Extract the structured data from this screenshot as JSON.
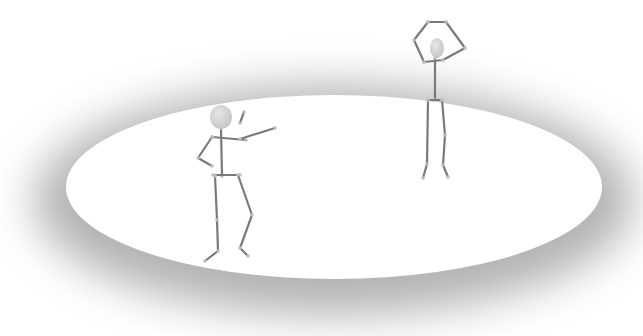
{
  "scene": {
    "description": "Two stick figures on an elliptical white platform with soft gray shadow",
    "colors": {
      "background": "#ffffff",
      "platform": "#ffffff",
      "shadow": "#9a9a9a",
      "limb": "#7a7a7a",
      "joint": "#bdbdbd",
      "head": "#d4d4d4"
    },
    "platform": {
      "cx": 334,
      "cy": 187,
      "rx": 268,
      "ry": 92
    },
    "figures": [
      {
        "name": "pointing-figure",
        "pose": "one hand on hip, other arm extended",
        "head": {
          "cx": 221,
          "cy": 117,
          "rx": 11,
          "ry": 12
        },
        "limbs": [
          [
            [
              221,
              128
            ],
            [
              222,
              176
            ]
          ],
          [
            [
              212,
              137
            ],
            [
              246,
              140
            ]
          ],
          [
            [
              212,
              137
            ],
            [
              198,
              158
            ],
            [
              212,
              166
            ]
          ],
          [
            [
              240,
              139
            ],
            [
              275,
              128
            ]
          ],
          [
            [
              244,
              112
            ],
            [
              240,
              123
            ]
          ],
          [
            [
              213,
              175
            ],
            [
              240,
              175
            ]
          ],
          [
            [
              215,
              176
            ],
            [
              217,
              220
            ],
            [
              218,
              251
            ],
            [
              205,
              261
            ]
          ],
          [
            [
              238,
              175
            ],
            [
              252,
              215
            ],
            [
              240,
              248
            ],
            [
              248,
              256
            ]
          ]
        ]
      },
      {
        "name": "arms-raised-figure",
        "pose": "both arms raised above head",
        "head": {
          "cx": 437,
          "cy": 48,
          "rx": 7,
          "ry": 10
        },
        "limbs": [
          [
            [
              435,
              58
            ],
            [
              435,
              100
            ]
          ],
          [
            [
              424,
              62
            ],
            [
              443,
              60
            ]
          ],
          [
            [
              424,
              62
            ],
            [
              414,
              40
            ],
            [
              428,
              22
            ]
          ],
          [
            [
              443,
              60
            ],
            [
              465,
              48
            ],
            [
              446,
              22
            ]
          ],
          [
            [
              428,
              22
            ],
            [
              446,
              22
            ]
          ],
          [
            [
              428,
              100
            ],
            [
              442,
              100
            ]
          ],
          [
            [
              428,
              100
            ],
            [
              427,
              164
            ],
            [
              423,
              178
            ]
          ],
          [
            [
              442,
              100
            ],
            [
              445,
              135
            ],
            [
              443,
              165
            ],
            [
              448,
              177
            ]
          ]
        ]
      }
    ]
  }
}
